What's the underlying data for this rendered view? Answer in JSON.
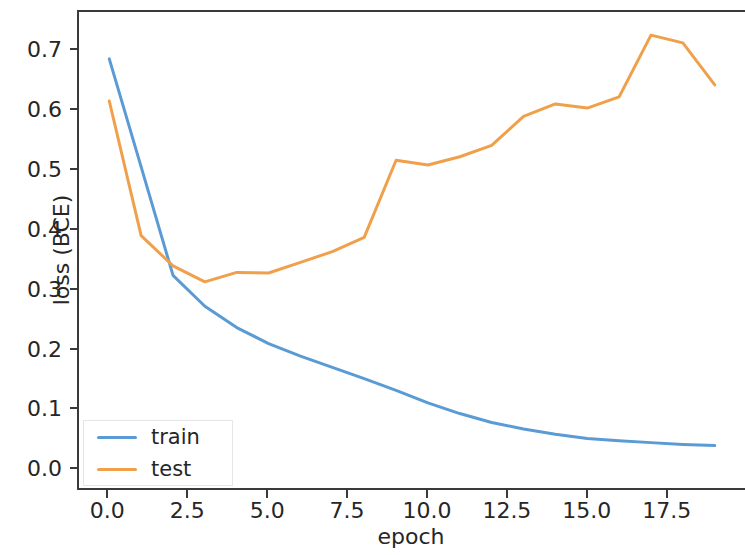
{
  "chart_data": {
    "type": "line",
    "title": "",
    "xlabel": "epoch",
    "ylabel": "loss (BCE)",
    "xlim": [
      -0.95,
      19.95
    ],
    "ylim": [
      -0.0365,
      0.766
    ],
    "xticks": [
      "0.0",
      "2.5",
      "5.0",
      "7.5",
      "10.0",
      "12.5",
      "15.0",
      "17.5"
    ],
    "xtick_values": [
      0.0,
      2.5,
      5.0,
      7.5,
      10.0,
      12.5,
      15.0,
      17.5
    ],
    "yticks": [
      "0.0",
      "0.1",
      "0.2",
      "0.3",
      "0.4",
      "0.5",
      "0.6",
      "0.7"
    ],
    "ytick_values": [
      0.0,
      0.1,
      0.2,
      0.3,
      0.4,
      0.5,
      0.6,
      0.7
    ],
    "grid": false,
    "legend_position": "lower left",
    "x": [
      0,
      1,
      2,
      3,
      4,
      5,
      6,
      7,
      8,
      9,
      10,
      11,
      12,
      13,
      14,
      15,
      16,
      17,
      18,
      19
    ],
    "series": [
      {
        "name": "train",
        "color": "#5b9bd5",
        "values": [
          0.687,
          0.505,
          0.322,
          0.27,
          0.234,
          0.207,
          0.186,
          0.167,
          0.148,
          0.128,
          0.107,
          0.089,
          0.074,
          0.063,
          0.054,
          0.047,
          0.043,
          0.04,
          0.037,
          0.035
        ]
      },
      {
        "name": "test",
        "color": "#f0a04b",
        "values": [
          0.616,
          0.389,
          0.338,
          0.311,
          0.327,
          0.326,
          0.344,
          0.362,
          0.386,
          0.516,
          0.508,
          0.522,
          0.541,
          0.59,
          0.611,
          0.604,
          0.623,
          0.727,
          0.714,
          0.643
        ]
      }
    ]
  },
  "axes": {
    "ylabel": "loss (BCE)",
    "xlabel": "epoch"
  },
  "legend": {
    "entries": [
      {
        "label": "train",
        "color": "#5b9bd5"
      },
      {
        "label": "test",
        "color": "#f0a04b"
      }
    ]
  }
}
